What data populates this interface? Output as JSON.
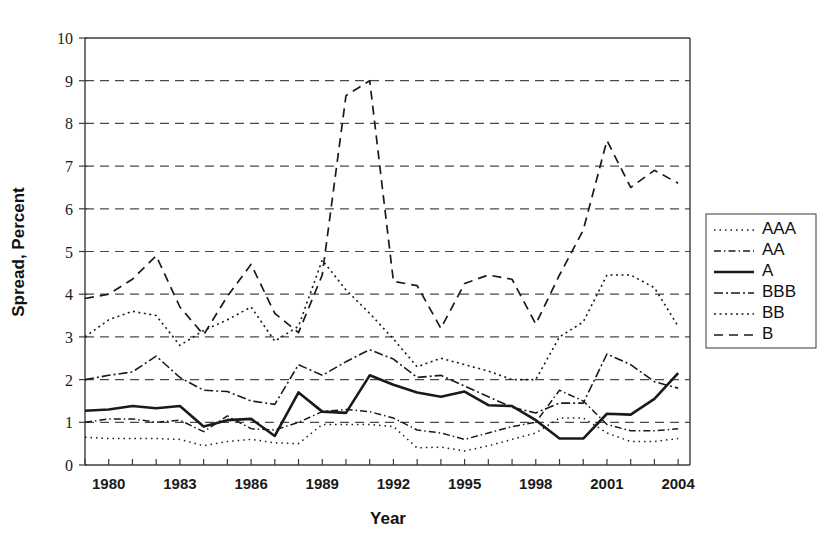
{
  "chart_data": {
    "type": "line",
    "title": "",
    "xlabel": "Year",
    "ylabel": "Spread, Percent",
    "xlim": [
      1979,
      2004.5
    ],
    "ylim": [
      0,
      10
    ],
    "grid": true,
    "legend_position": "right",
    "x_tick_labels": [
      "1980",
      "1983",
      "1986",
      "1989",
      "1992",
      "1995",
      "1998",
      "2001",
      "2004"
    ],
    "x_tick_values": [
      1980,
      1983,
      1986,
      1989,
      1992,
      1995,
      1998,
      2001,
      2004
    ],
    "x_minor_ticks": [
      1979,
      1980,
      1981,
      1982,
      1983,
      1984,
      1985,
      1986,
      1987,
      1988,
      1989,
      1990,
      1991,
      1992,
      1993,
      1994,
      1995,
      1996,
      1997,
      1998,
      1999,
      2000,
      2001,
      2002,
      2003,
      2004
    ],
    "y_tick_labels": [
      "0",
      "1",
      "2",
      "3",
      "4",
      "5",
      "6",
      "7",
      "8",
      "9",
      "10"
    ],
    "y_tick_values": [
      0,
      1,
      2,
      3,
      4,
      5,
      6,
      7,
      8,
      9,
      10
    ],
    "x": [
      1979,
      1980,
      1981,
      1982,
      1983,
      1984,
      1985,
      1986,
      1987,
      1988,
      1989,
      1990,
      1991,
      1992,
      1993,
      1994,
      1995,
      1996,
      1997,
      1998,
      1999,
      2000,
      2001,
      2002,
      2003,
      2004
    ],
    "series": [
      {
        "name": "AAA",
        "dash": "dotted",
        "width": 1.5,
        "dasharray": "1.5 4",
        "values": [
          0.65,
          0.62,
          0.62,
          0.62,
          0.6,
          0.45,
          0.55,
          0.6,
          0.52,
          0.5,
          0.95,
          0.95,
          0.95,
          0.9,
          0.4,
          0.42,
          0.33,
          0.45,
          0.6,
          0.75,
          1.1,
          1.1,
          0.75,
          0.55,
          0.55,
          0.62
        ]
      },
      {
        "name": "AA",
        "dash": "dashdot",
        "width": 1.5,
        "dasharray": "7 3 1.5 3",
        "values": [
          1.0,
          1.08,
          1.08,
          1.0,
          1.05,
          0.78,
          1.15,
          0.85,
          0.82,
          1.0,
          1.25,
          1.3,
          1.25,
          1.1,
          0.82,
          0.75,
          0.6,
          0.75,
          0.9,
          1.0,
          1.75,
          1.5,
          0.95,
          0.8,
          0.8,
          0.85
        ]
      },
      {
        "name": "A",
        "dash": "solid",
        "width": 2.6,
        "dasharray": "none",
        "values": [
          1.27,
          1.3,
          1.38,
          1.33,
          1.38,
          0.9,
          1.05,
          1.08,
          0.68,
          1.7,
          1.25,
          1.22,
          2.1,
          1.88,
          1.7,
          1.6,
          1.72,
          1.4,
          1.38,
          1.05,
          0.62,
          0.62,
          1.2,
          1.18,
          1.55,
          2.15
        ]
      },
      {
        "name": "BBB",
        "dash": "dashdot",
        "width": 1.6,
        "dasharray": "9 3 2 3",
        "values": [
          2.0,
          2.1,
          2.18,
          2.55,
          2.05,
          1.75,
          1.72,
          1.5,
          1.42,
          2.35,
          2.1,
          2.42,
          2.7,
          2.48,
          2.05,
          2.1,
          1.85,
          1.6,
          1.35,
          1.22,
          1.45,
          1.45,
          2.6,
          2.35,
          1.95,
          1.8
        ]
      },
      {
        "name": "BB",
        "dash": "dotted",
        "width": 1.6,
        "dasharray": "2 3.5",
        "values": [
          3.0,
          3.4,
          3.6,
          3.5,
          2.8,
          3.15,
          3.4,
          3.7,
          2.9,
          3.25,
          4.8,
          4.1,
          3.55,
          2.95,
          2.3,
          2.5,
          2.35,
          2.2,
          2.0,
          2.0,
          3.0,
          3.35,
          4.45,
          4.45,
          4.15,
          3.25
        ]
      },
      {
        "name": "B",
        "dash": "dashed",
        "width": 1.7,
        "dasharray": "9 6",
        "values": [
          3.9,
          4.0,
          4.35,
          4.9,
          3.7,
          3.05,
          3.95,
          4.7,
          3.55,
          3.1,
          4.45,
          8.65,
          9.0,
          4.3,
          4.2,
          3.2,
          4.25,
          4.45,
          4.35,
          3.3,
          4.45,
          5.5,
          7.6,
          6.5,
          6.9,
          6.6
        ]
      }
    ],
    "series_tail": {
      "note_x": [
        2002,
        2003,
        2004
      ],
      "B_tail": [
        2.9,
        3.45,
        3.7
      ],
      "BB_tail": [
        2.25,
        3.0,
        3.3
      ],
      "BBB_tail": [
        1.35,
        1.6,
        1.62
      ],
      "A_tail": [
        0.95,
        1.0,
        1.0
      ],
      "AA_tail": [
        0.78,
        0.82,
        0.85
      ],
      "AAA_tail": [
        0.6,
        0.62,
        0.65
      ]
    },
    "colors": {
      "line": "#1a1a1a",
      "grid": "#4a4a4a",
      "axis": "#3b3b3b",
      "background": "#ffffff"
    }
  },
  "legend": {
    "items": [
      {
        "label": "AAA"
      },
      {
        "label": "AA"
      },
      {
        "label": "A"
      },
      {
        "label": "BBB"
      },
      {
        "label": "BB"
      },
      {
        "label": "B"
      }
    ]
  }
}
